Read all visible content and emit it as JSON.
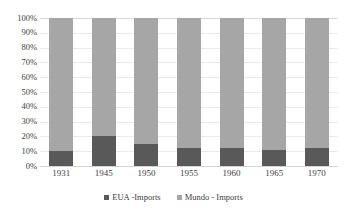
{
  "chart_data": {
    "type": "bar",
    "variant": "stacked-100-percent",
    "title": "",
    "subtitle": "",
    "xlabel": "",
    "ylabel": "",
    "categories": [
      "1931",
      "1945",
      "1950",
      "1955",
      "1960",
      "1965",
      "1970"
    ],
    "series": [
      {
        "name": "EUA -Imports",
        "color": "#595959",
        "values": [
          10,
          20,
          15,
          12,
          12,
          11,
          12
        ]
      },
      {
        "name": "Mundo - Imports",
        "color": "#a6a6a6",
        "values": [
          90,
          80,
          85,
          88,
          88,
          89,
          88
        ]
      }
    ],
    "ylim": [
      0,
      100
    ],
    "ytick_values": [
      0,
      10,
      20,
      30,
      40,
      50,
      60,
      70,
      80,
      90,
      100
    ],
    "ytick_labels": [
      "0%",
      "10%",
      "20%",
      "30%",
      "40%",
      "50%",
      "60%",
      "70%",
      "80%",
      "90%",
      "100%"
    ],
    "grid": true,
    "grid_axis": "y",
    "legend_position": "bottom",
    "legend_orientation": "horizontal",
    "background_color": "#ffffff",
    "gridline_color": "#eaeaea"
  },
  "clipped_title": "",
  "legend": {
    "entries": [
      {
        "label": "EUA -Imports",
        "marker": "square-marker",
        "color": "#595959"
      },
      {
        "label": "Mundo - Imports",
        "marker": "square-marker",
        "color": "#a6a6a6"
      }
    ]
  }
}
